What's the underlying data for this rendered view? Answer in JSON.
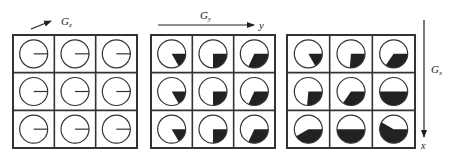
{
  "diagram": {
    "title": "",
    "colors": {
      "line": "#333333",
      "fill": "#222222",
      "background": "#ffffff"
    },
    "labels": {
      "gz": "G",
      "gz_sub": "z",
      "gy": "G",
      "gy_sub": "y",
      "gy_axis": "y",
      "gx": "G",
      "gx_sub": "x",
      "gx_axis": "x"
    },
    "grids": [
      {
        "name": "after-slice-select-gz",
        "x": 13,
        "y": 35,
        "w": 124,
        "h": 113,
        "phases_deg": [
          [
            0,
            0,
            0
          ],
          [
            0,
            0,
            0
          ],
          [
            0,
            0,
            0
          ]
        ]
      },
      {
        "name": "after-phase-encode-gy",
        "x": 151,
        "y": 35,
        "w": 124,
        "h": 113,
        "phases_deg": [
          [
            60,
            90,
            115
          ],
          [
            60,
            90,
            115
          ],
          [
            60,
            90,
            115
          ]
        ]
      },
      {
        "name": "after-frequency-encode-gx",
        "x": 287,
        "y": 35,
        "w": 128,
        "h": 113,
        "phases_deg": [
          [
            60,
            95,
            125
          ],
          [
            95,
            125,
            180
          ],
          [
            150,
            180,
            210
          ]
        ]
      }
    ]
  }
}
